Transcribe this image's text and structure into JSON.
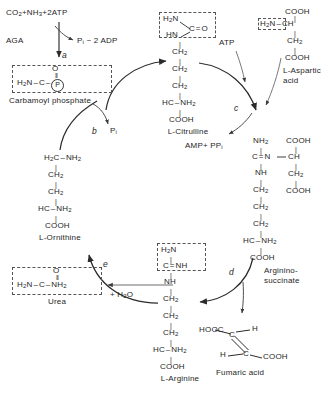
{
  "diagram": {
    "type": "biochemical-pathway",
    "background": "#ffffff",
    "ink": "#262626"
  },
  "inputs": {
    "substrates_top": "CO2+NH3+2ATP",
    "cofactor_aga": "AGA",
    "byproduct_top": "Pi - 2 ADP",
    "atp": "ATP",
    "amp_ppi": "AMP+ PPi",
    "pi": "Pi",
    "water": "+ H2O"
  },
  "steps": [
    {
      "id": "a",
      "label": "a"
    },
    {
      "id": "b",
      "label": "b"
    },
    {
      "id": "c",
      "label": "c"
    },
    {
      "id": "d",
      "label": "d"
    },
    {
      "id": "e",
      "label": "e"
    }
  ],
  "metabolites": {
    "carbamoyl_phosphate": {
      "name": "Carbamoyl phosphate",
      "lines": [
        "O",
        "H2N-C-(P)"
      ]
    },
    "citrulline": {
      "name": "L-Citrulline",
      "head": [
        "H2N",
        "HN",
        "C=O"
      ],
      "chain": [
        "CH2",
        "CH2",
        "CH2",
        "HC-NH2",
        "COOH"
      ]
    },
    "aspartic_acid": {
      "name_line1": "L-Aspartic",
      "name_line2": "acid",
      "lines": [
        "COOH",
        "H2N-CH",
        "CH2",
        "COOH"
      ],
      "boxed": "H2N"
    },
    "argininosuccinate": {
      "name_line1": "Arginino-",
      "name_line2": "succinate",
      "left_chain": [
        "NH2",
        "C=N-",
        "NH",
        "CH2",
        "CH2",
        "CH2",
        "HC-NH2",
        "COOH"
      ],
      "right_chain": [
        "COOH",
        "CH",
        "CH2",
        "COOH"
      ]
    },
    "fumaric_acid": {
      "name": "Fumaric acid",
      "left_top": "HOOC",
      "right_top": "H",
      "left_bottom": "H",
      "right_bottom": "COOH",
      "c_upper": "C",
      "c_lower": "C"
    },
    "arginine": {
      "name": "L-Arginine",
      "head": [
        "H2N",
        "C=NH"
      ],
      "chain": [
        "NH",
        "CH2",
        "CH2",
        "CH2",
        "HC-NH2",
        "COOH"
      ]
    },
    "ornithine": {
      "name": "L-Ornithine",
      "chain": [
        "H2C-NH2",
        "CH2",
        "CH2",
        "HC-NH2",
        "COOH"
      ]
    },
    "urea": {
      "name": "Urea",
      "lines": [
        "O",
        "H2N-C-NH2"
      ]
    }
  }
}
